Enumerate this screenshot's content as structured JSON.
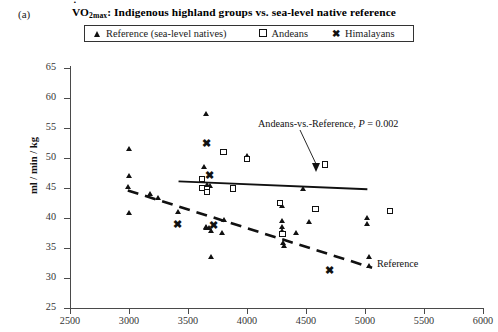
{
  "panel": {
    "label": "(a)"
  },
  "title": {
    "prefix": "VO",
    "subscript": "2max",
    "rest": ": Indigenous highland groups vs. sea-level native reference"
  },
  "legend": {
    "items": [
      {
        "glyph": "triangle",
        "label": "Reference (sea-level natives)"
      },
      {
        "glyph": "square",
        "label": "Andeans"
      },
      {
        "glyph": "cross",
        "label": "Himalayans"
      }
    ]
  },
  "annotations": {
    "pvalue": {
      "text": "Andeans-vs.-Reference, ",
      "italic": "P",
      "value": " = 0.002"
    },
    "reference_line_label": "Reference"
  },
  "chart_data": {
    "type": "scatter",
    "title": "VO2max: Indigenous highland groups vs. sea-level native reference",
    "xlabel": "",
    "ylabel": "ml / min / kg",
    "xlim": [
      2500,
      6000
    ],
    "ylim": [
      25,
      65
    ],
    "xticks": [
      2500,
      3000,
      3500,
      4000,
      4500,
      5000,
      5500,
      6000
    ],
    "yticks": [
      25,
      30,
      35,
      40,
      45,
      50,
      55,
      60,
      65
    ],
    "grid": false,
    "legend_position": "top",
    "series": [
      {
        "name": "Reference (sea-level natives)",
        "marker": "triangle",
        "points": [
          [
            3000,
            51.0
          ],
          [
            3000,
            46.5
          ],
          [
            2995,
            44.7
          ],
          [
            3000,
            40.3
          ],
          [
            3250,
            42.8
          ],
          [
            3180,
            43.6
          ],
          [
            3420,
            40.5
          ],
          [
            3640,
            48.0
          ],
          [
            3660,
            56.9
          ],
          [
            3665,
            45.0
          ],
          [
            3690,
            44.8
          ],
          [
            3660,
            38.0
          ],
          [
            3680,
            37.8
          ],
          [
            3700,
            37.4
          ],
          [
            3700,
            33.0
          ],
          [
            3790,
            37.1
          ],
          [
            3810,
            39.2
          ],
          [
            3660,
            37.9
          ],
          [
            4000,
            49.8
          ],
          [
            4000,
            49.5
          ],
          [
            4300,
            41.6
          ],
          [
            4300,
            38.0
          ],
          [
            4300,
            37.4
          ],
          [
            4310,
            35.4
          ],
          [
            4320,
            34.8
          ],
          [
            4420,
            37.0
          ],
          [
            4530,
            38.8
          ],
          [
            4300,
            39.0
          ],
          [
            5020,
            39.5
          ],
          [
            5020,
            38.5
          ],
          [
            5040,
            33.0
          ],
          [
            5040,
            31.5
          ],
          [
            4480,
            44.3
          ]
        ]
      },
      {
        "name": "Andeans",
        "marker": "square",
        "points": [
          [
            3620,
            46.5
          ],
          [
            3620,
            45.0
          ],
          [
            3660,
            44.8
          ],
          [
            3800,
            51.0
          ],
          [
            3880,
            44.9
          ],
          [
            4000,
            49.8
          ],
          [
            4280,
            42.5
          ],
          [
            4300,
            37.3
          ],
          [
            4580,
            41.5
          ],
          [
            4660,
            48.9
          ],
          [
            5210,
            41.2
          ],
          [
            3660,
            44.3
          ]
        ]
      },
      {
        "name": "Himalayans",
        "marker": "cross",
        "points": [
          [
            3660,
            51.7
          ],
          [
            3680,
            46.4
          ],
          [
            3720,
            38.0
          ],
          [
            3410,
            38.2
          ],
          [
            4700,
            30.5
          ]
        ]
      }
    ],
    "trend_lines": [
      {
        "name": "Andeans",
        "style": "solid",
        "x_start": 3420,
        "y_start": 46.1,
        "x_end": 5020,
        "y_end": 44.8
      },
      {
        "name": "Reference",
        "style": "dashed",
        "x_start": 2990,
        "y_start": 44.6,
        "x_end": 5060,
        "y_end": 31.7
      }
    ]
  }
}
